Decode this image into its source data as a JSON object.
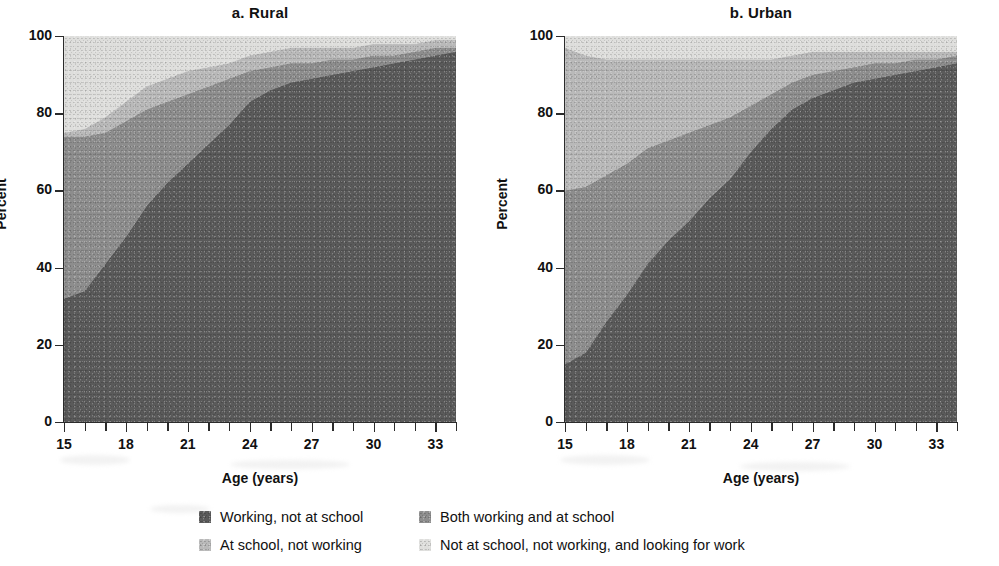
{
  "figure": {
    "panels": [
      {
        "key": "rural",
        "title": "a.  Rural"
      },
      {
        "key": "urban",
        "title": "b.  Urban"
      }
    ],
    "axis": {
      "y_title": "Percent",
      "x_title": "Age (years)",
      "y_ticks": [
        "0",
        "20",
        "40",
        "60",
        "80",
        "100"
      ],
      "x_ticks_major": [
        "15",
        "18",
        "21",
        "24",
        "27",
        "30",
        "33"
      ]
    },
    "legend": {
      "items": [
        {
          "label": "Working, not at school",
          "color": "#5a5a5a"
        },
        {
          "label": "Both working and at school",
          "color": "#8d8d8d"
        },
        {
          "label": "At school, not working",
          "color": "#b9b9b9"
        },
        {
          "label": "Not at school, not working, and looking for work",
          "color": "#dededc"
        }
      ]
    }
  },
  "chart_data": [
    {
      "type": "area",
      "stacked": true,
      "title": "a.  Rural",
      "xlabel": "Age (years)",
      "ylabel": "Percent",
      "xlim": [
        15,
        34
      ],
      "ylim": [
        0,
        100
      ],
      "grid": false,
      "legend_position": "bottom",
      "x": [
        15,
        16,
        17,
        18,
        19,
        20,
        21,
        22,
        23,
        24,
        25,
        26,
        27,
        28,
        29,
        30,
        31,
        32,
        33,
        34
      ],
      "series": [
        {
          "name": "Working, not at school",
          "color": "#5a5a5a",
          "values": [
            32,
            34,
            41,
            48,
            56,
            62,
            67,
            72,
            77,
            83,
            86,
            88,
            89,
            90,
            91,
            92,
            93,
            94,
            95,
            96
          ]
        },
        {
          "name": "Both working and at school",
          "color": "#8d8d8d",
          "values": [
            42,
            40,
            34,
            30,
            25,
            21,
            18,
            15,
            12,
            8,
            6,
            5,
            4,
            4,
            3,
            3,
            2,
            2,
            2,
            1
          ]
        },
        {
          "name": "At school, not working",
          "color": "#b9b9b9",
          "values": [
            1,
            2,
            4,
            5,
            6,
            6,
            6,
            5,
            4,
            4,
            4,
            4,
            4,
            3,
            3,
            3,
            3,
            2,
            2,
            2
          ]
        },
        {
          "name": "Not at school, not working, and looking for work",
          "color": "#dededc",
          "values": [
            25,
            24,
            21,
            17,
            13,
            11,
            9,
            8,
            7,
            5,
            4,
            3,
            3,
            3,
            3,
            2,
            2,
            2,
            1,
            1
          ]
        }
      ]
    },
    {
      "type": "area",
      "stacked": true,
      "title": "b.  Urban",
      "xlabel": "Age (years)",
      "ylabel": "Percent",
      "xlim": [
        15,
        34
      ],
      "ylim": [
        0,
        100
      ],
      "grid": false,
      "legend_position": "bottom",
      "x": [
        15,
        16,
        17,
        18,
        19,
        20,
        21,
        22,
        23,
        24,
        25,
        26,
        27,
        28,
        29,
        30,
        31,
        32,
        33,
        34
      ],
      "series": [
        {
          "name": "Working, not at school",
          "color": "#5a5a5a",
          "values": [
            15,
            18,
            26,
            33,
            41,
            47,
            52,
            58,
            63,
            70,
            76,
            81,
            84,
            86,
            88,
            89,
            90,
            91,
            92,
            93
          ]
        },
        {
          "name": "Both working and at school",
          "color": "#8d8d8d",
          "values": [
            45,
            43,
            38,
            34,
            30,
            26,
            23,
            19,
            16,
            12,
            9,
            7,
            6,
            5,
            4,
            4,
            3,
            3,
            2,
            2
          ]
        },
        {
          "name": "At school, not working",
          "color": "#b9b9b9",
          "values": [
            37,
            34,
            30,
            27,
            23,
            21,
            19,
            17,
            15,
            12,
            9,
            7,
            6,
            5,
            4,
            3,
            3,
            2,
            2,
            1
          ]
        },
        {
          "name": "Not at school, not working, and looking for work",
          "color": "#dededc",
          "values": [
            3,
            5,
            6,
            6,
            6,
            6,
            6,
            6,
            6,
            6,
            6,
            5,
            4,
            4,
            4,
            4,
            4,
            4,
            4,
            4
          ]
        }
      ]
    }
  ]
}
